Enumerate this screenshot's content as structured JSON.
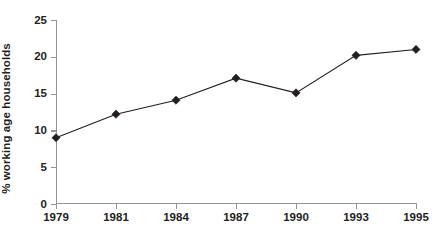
{
  "chart_data": {
    "type": "line",
    "title": "",
    "xlabel": "",
    "ylabel": "% working age households",
    "categories": [
      "1979",
      "1981",
      "1984",
      "1987",
      "1990",
      "1993",
      "1995"
    ],
    "values": [
      9.0,
      12.2,
      14.1,
      17.1,
      15.1,
      20.2,
      21.0
    ],
    "series": [
      {
        "name": "% working age households",
        "values": [
          9.0,
          12.2,
          14.1,
          17.1,
          15.1,
          20.2,
          21.0
        ]
      }
    ],
    "ylim": [
      0,
      25
    ],
    "y_ticks": [
      0,
      5,
      10,
      15,
      20,
      25
    ],
    "y_tick_labels": [
      "0",
      "5",
      "10",
      "15",
      "20",
      "25"
    ],
    "x_tick_labels": [
      "1979",
      "1981",
      "1984",
      "1987",
      "1990",
      "1993",
      "1995"
    ],
    "grid": false,
    "legend": false,
    "legend_position": "none",
    "marker": "diamond",
    "line_color": "#231f20",
    "marker_color": "#231f20",
    "axis_color": "#939598",
    "background_color": "#ffffff"
  }
}
